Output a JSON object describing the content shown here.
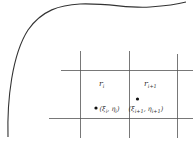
{
  "diagram": {
    "colors": {
      "curve": "#333333",
      "grid": "#555555",
      "text": "#333333",
      "point": "#111111",
      "background": "#ffffff"
    },
    "region_labels": [
      {
        "base": "r",
        "sub": "i"
      },
      {
        "base": "r",
        "sub": "i+1"
      }
    ],
    "points": [
      {
        "label_open": "(",
        "xi": "ξ",
        "xi_sub": "i",
        "sep": ", ",
        "eta": "η",
        "eta_sub": "i",
        "label_close": ")"
      },
      {
        "label_open": "(",
        "xi": "ξ",
        "xi_sub": "i+1",
        "sep": ", ",
        "eta": "η",
        "eta_sub": "i+1",
        "label_close": ")"
      }
    ]
  }
}
